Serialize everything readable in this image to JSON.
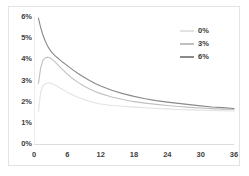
{
  "chart_data": {
    "type": "line",
    "title": "",
    "subtitle": "",
    "xlabel": "",
    "ylabel": "",
    "xlim": [
      0,
      36
    ],
    "ylim": [
      0,
      0.06
    ],
    "grid": false,
    "legend_position": "top-right",
    "x_tick_labels": [
      "0",
      "6",
      "12",
      "18",
      "24",
      "30",
      "36"
    ],
    "x_tick_values": [
      0,
      6,
      12,
      18,
      24,
      30,
      36
    ],
    "y_tick_labels": [
      "0%",
      "1%",
      "2%",
      "3%",
      "4%",
      "5%",
      "6%"
    ],
    "y_tick_values": [
      0,
      1,
      2,
      3,
      4,
      5,
      6
    ],
    "x": [
      0.8,
      1.2,
      1.6,
      2,
      2.5,
      3,
      3.5,
      4,
      5,
      6,
      7,
      8,
      9,
      10,
      11,
      12,
      14,
      16,
      18,
      20,
      22,
      24,
      26,
      28,
      30,
      32,
      34,
      36
    ],
    "series": [
      {
        "name": "0%",
        "color": "#e2e2e2",
        "values": [
          1.55,
          2.45,
          2.74,
          2.84,
          2.89,
          2.87,
          2.82,
          2.75,
          2.6,
          2.45,
          2.32,
          2.2,
          2.1,
          2.02,
          1.95,
          1.89,
          1.82,
          1.78,
          1.74,
          1.71,
          1.68,
          1.66,
          1.63,
          1.61,
          1.6,
          1.58,
          1.57,
          1.56
        ]
      },
      {
        "name": "3%",
        "color": "#c0c0c0",
        "values": [
          2.85,
          3.6,
          3.95,
          4.06,
          4.1,
          4.05,
          3.94,
          3.82,
          3.55,
          3.3,
          3.08,
          2.9,
          2.74,
          2.6,
          2.48,
          2.38,
          2.22,
          2.1,
          2.0,
          1.93,
          1.87,
          1.82,
          1.77,
          1.73,
          1.7,
          1.67,
          1.65,
          1.63
        ]
      },
      {
        "name": "6%",
        "color": "#8a8a8a",
        "values": [
          5.95,
          5.5,
          5.15,
          4.88,
          4.6,
          4.4,
          4.25,
          4.12,
          3.9,
          3.7,
          3.5,
          3.32,
          3.15,
          3.0,
          2.86,
          2.74,
          2.54,
          2.38,
          2.25,
          2.14,
          2.05,
          1.98,
          1.92,
          1.86,
          1.8,
          1.75,
          1.72,
          1.68
        ]
      }
    ]
  },
  "legend": {
    "items": [
      {
        "label": "0%"
      },
      {
        "label": "3%"
      },
      {
        "label": "6%"
      }
    ]
  },
  "axes": {
    "y_labels": [
      "6%",
      "5%",
      "4%",
      "3%",
      "2%",
      "1%",
      "0%"
    ],
    "x_labels": [
      "0",
      "6",
      "12",
      "18",
      "24",
      "30",
      "36"
    ]
  },
  "colors": {
    "frame": "#e3e3e3",
    "axis": "#dcdcdc",
    "tick_text": "#404040",
    "series_0": "#e2e2e2",
    "series_3": "#c0c0c0",
    "series_6": "#8a8a8a",
    "background": "#ffffff"
  }
}
